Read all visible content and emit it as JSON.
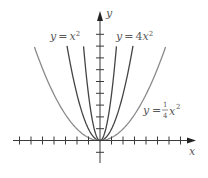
{
  "chart_data": {
    "type": "line",
    "title": "",
    "xlabel": "x",
    "ylabel": "y",
    "grid": false,
    "legend_position": "inline labels",
    "axis_ticks": {
      "x_ticks": [
        -7,
        -6,
        -5,
        -4,
        -3,
        -2,
        -1,
        1,
        2,
        3,
        4,
        5,
        6,
        7
      ],
      "y_ticks": [
        -1,
        1,
        2,
        3,
        4,
        5,
        6,
        7,
        8,
        9
      ],
      "tick_labels_shown": false
    },
    "xlim": [
      -7.6,
      8.2
    ],
    "ylim": [
      -1.9,
      10.9
    ],
    "series": [
      {
        "name": "y = x²",
        "function": "x^2",
        "coefficient": 1,
        "domain": [
          -2.87,
          2.87
        ],
        "color": "#444444",
        "label": {
          "prefix": "y = x",
          "exp": "2"
        }
      },
      {
        "name": "y = 4x²",
        "function": "4x^2",
        "coefficient": 4,
        "domain": [
          -1.43,
          1.43
        ],
        "color": "#444444",
        "label": {
          "prefix": "y = 4x",
          "exp": "2"
        }
      },
      {
        "name": "y = (1/4)x²",
        "function": "(1/4)x^2",
        "coefficient": 0.25,
        "domain": [
          -5.7,
          5.7
        ],
        "color": "#8a8a8a",
        "label": {
          "prefix": "y = ",
          "num": "1",
          "den": "4",
          "var": "x",
          "exp": "2"
        }
      }
    ]
  },
  "axes": {
    "x_label": "x",
    "y_label": "y"
  }
}
